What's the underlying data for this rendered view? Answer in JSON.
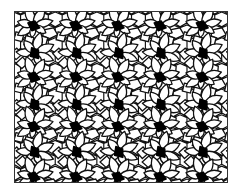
{
  "figure": {
    "frame": {
      "x": 14,
      "y": 11,
      "width": 214,
      "height": 172
    },
    "colors": {
      "background": "#ffffff",
      "stroke": "#111111",
      "hub": "#000000",
      "frame": "#333333"
    },
    "stroke_width": 1.3,
    "lattice": {
      "columns_x": [
        19,
        61.5,
        104,
        146.5,
        189
      ],
      "rows": [
        {
          "y": 14,
          "dx": 0,
          "rot": 0
        },
        {
          "y": 42,
          "dx": 1,
          "rot": 35
        },
        {
          "y": 66,
          "dx": 0,
          "rot": 0
        },
        {
          "y": 94,
          "dx": 1,
          "rot": 35
        },
        {
          "y": 116,
          "dx": 0,
          "rot": 0
        },
        {
          "y": 142,
          "dx": 1,
          "rot": 35
        },
        {
          "y": 167,
          "dx": 0,
          "rot": 0
        }
      ],
      "extra_columns_x": [
        -23.5,
        231.5
      ]
    },
    "hub_shape": [
      [
        -6,
        -3
      ],
      [
        1,
        -5
      ],
      [
        6,
        2
      ],
      [
        -2,
        5
      ]
    ],
    "petals": [
      {
        "angle": -110,
        "length": 22,
        "width": 9
      },
      {
        "angle": -60,
        "length": 21,
        "width": 9
      },
      {
        "angle": -15,
        "length": 20,
        "width": 8
      },
      {
        "angle": 30,
        "length": 14,
        "width": 7
      },
      {
        "angle": 150,
        "length": 19,
        "width": 8
      },
      {
        "angle": 195,
        "length": 17,
        "width": 8
      },
      {
        "angle": 100,
        "length": 12,
        "width": 6
      }
    ],
    "filler_cells": [
      {
        "points": [
          [
            10,
            4
          ],
          [
            20,
            2
          ],
          [
            24,
            9
          ],
          [
            16,
            13
          ],
          [
            9,
            10
          ]
        ]
      },
      {
        "points": [
          [
            -18,
            6
          ],
          [
            -10,
            8
          ],
          [
            -12,
            16
          ],
          [
            -20,
            14
          ]
        ]
      },
      {
        "points": [
          [
            6,
            10
          ],
          [
            14,
            12
          ],
          [
            12,
            20
          ],
          [
            4,
            18
          ]
        ]
      },
      {
        "points": [
          [
            -8,
            10
          ],
          [
            0,
            12
          ],
          [
            -2,
            20
          ],
          [
            -10,
            19
          ]
        ]
      }
    ]
  }
}
